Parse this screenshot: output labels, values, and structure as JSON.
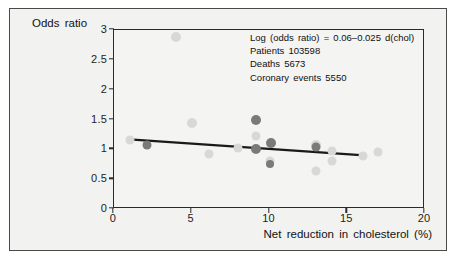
{
  "figure": {
    "background_color": "#f2f2f0",
    "border_color": "#4a4a4a"
  },
  "annotation": {
    "line1": "Log (odds ratio) = 0.06–0.025 d(chol)",
    "line2": "Patients 103598",
    "line3": "Deaths 5673",
    "line4": "Coronary events 5550"
  },
  "chart_data": {
    "type": "scatter",
    "title": "",
    "xlabel": "Net reduction in cholesterol (%)",
    "ylabel": "Odds ratio",
    "xlim": [
      0,
      20
    ],
    "ylim": [
      0,
      3
    ],
    "xticks": [
      "0",
      "5",
      "10",
      "15",
      "20"
    ],
    "xtick_values": [
      0,
      5,
      10,
      15,
      20
    ],
    "yticks": [
      "0",
      "0.5",
      "1",
      "1.5",
      "2",
      "2.5",
      "3"
    ],
    "ytick_values": [
      0,
      0.5,
      1,
      1.5,
      2,
      2.5,
      3
    ],
    "grid": false,
    "legend": null,
    "marker_colors": {
      "light": "#d8d8d8",
      "medium": "#bdbdbd",
      "dark": "#7a7a7a"
    },
    "points": [
      {
        "x": 1.0,
        "y": 1.15,
        "shade": "light",
        "size": 9
      },
      {
        "x": 2.1,
        "y": 1.08,
        "shade": "dark",
        "size": 9
      },
      {
        "x": 4.0,
        "y": 2.88,
        "shade": "light",
        "size": 10
      },
      {
        "x": 5.0,
        "y": 1.44,
        "shade": "light",
        "size": 10
      },
      {
        "x": 6.1,
        "y": 0.92,
        "shade": "light",
        "size": 9
      },
      {
        "x": 8.0,
        "y": 1.02,
        "shade": "light",
        "size": 9
      },
      {
        "x": 9.1,
        "y": 1.49,
        "shade": "dark",
        "size": 10
      },
      {
        "x": 9.1,
        "y": 1.23,
        "shade": "light",
        "size": 9
      },
      {
        "x": 9.1,
        "y": 1.01,
        "shade": "dark",
        "size": 10
      },
      {
        "x": 10.1,
        "y": 1.11,
        "shade": "dark",
        "size": 10
      },
      {
        "x": 10.0,
        "y": 0.8,
        "shade": "light",
        "size": 9
      },
      {
        "x": 10.0,
        "y": 0.75,
        "shade": "dark",
        "size": 8
      },
      {
        "x": 13.0,
        "y": 1.07,
        "shade": "light",
        "size": 10
      },
      {
        "x": 13.0,
        "y": 1.04,
        "shade": "dark",
        "size": 9
      },
      {
        "x": 13.0,
        "y": 0.63,
        "shade": "light",
        "size": 9
      },
      {
        "x": 14.0,
        "y": 0.97,
        "shade": "light",
        "size": 9
      },
      {
        "x": 14.0,
        "y": 0.81,
        "shade": "light",
        "size": 9
      },
      {
        "x": 16.0,
        "y": 0.89,
        "shade": "light",
        "size": 9
      },
      {
        "x": 17.0,
        "y": 0.95,
        "shade": "light",
        "size": 9
      }
    ],
    "fit_line": {
      "label": "regression line",
      "color": "#1a1a1a",
      "width": 2.4,
      "x1": 1.0,
      "y1": 1.155,
      "x2": 16.2,
      "y2": 0.885
    }
  }
}
